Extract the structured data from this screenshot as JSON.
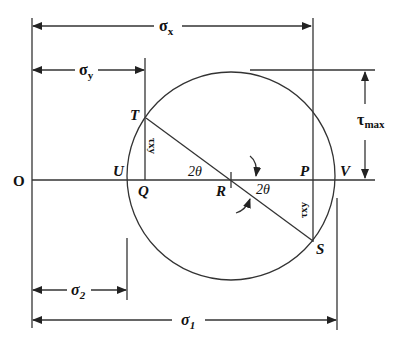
{
  "diagram": {
    "type": "Mohr's circle",
    "origin_label": "O",
    "points": {
      "T": "T",
      "U": "U",
      "Q": "Q",
      "R": "R",
      "P": "P",
      "V": "V",
      "S": "S"
    },
    "dimensions": {
      "sigma_x": {
        "symbol": "σ",
        "sub": "x"
      },
      "sigma_y": {
        "symbol": "σ",
        "sub": "y"
      },
      "sigma_1": {
        "symbol": "σ",
        "sub": "1"
      },
      "sigma_2": {
        "symbol": "σ",
        "sub": "2"
      },
      "tau_max": {
        "symbol": "τ",
        "sub": "max"
      }
    },
    "angle_labels": {
      "upper": "2θ",
      "lower": "2θ"
    },
    "shear_labels": {
      "left": "τxy",
      "right": "τxy"
    },
    "colors": {
      "line": "#333333",
      "text": "#111111",
      "background": "#ffffff"
    }
  }
}
